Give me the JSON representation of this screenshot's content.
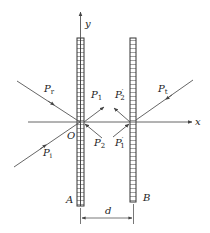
{
  "figure": {
    "type": "two-wall wave reflection/transmission diagram",
    "axes": {
      "x_label": "x",
      "y_label": "y",
      "origin_label": "O"
    },
    "walls": [
      {
        "label": "A",
        "position": "x=0"
      },
      {
        "label": "B",
        "position": "x=d"
      }
    ],
    "spacing_label": "d",
    "waves": [
      {
        "id": "Pi",
        "base": "P",
        "sub": "i",
        "prime": "",
        "desc": "incident wave"
      },
      {
        "id": "Pr",
        "base": "P",
        "sub": "r",
        "prime": "",
        "desc": "reflected wave"
      },
      {
        "id": "P1",
        "base": "P",
        "sub": "1",
        "prime": "",
        "desc": "transmitted through A"
      },
      {
        "id": "P2",
        "base": "P",
        "sub": "2",
        "prime": "",
        "desc": "returning to A"
      },
      {
        "id": "P1p",
        "base": "P",
        "sub": "1",
        "prime": "′",
        "desc": "arriving at B"
      },
      {
        "id": "P2p",
        "base": "P",
        "sub": "2",
        "prime": "′",
        "desc": "reflected at B"
      },
      {
        "id": "Pt",
        "base": "P",
        "sub": "t",
        "prime": "",
        "desc": "transmitted through B"
      }
    ],
    "colors": {
      "line": "#555555",
      "wall": "#333333",
      "text": "#222222"
    }
  }
}
